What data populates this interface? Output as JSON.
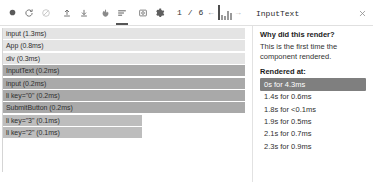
{
  "toolbar": {
    "icons": [
      {
        "name": "record-icon",
        "title": "Start recording"
      },
      {
        "name": "reload-icon",
        "title": "Reload and start profiling"
      },
      {
        "name": "clear-icon",
        "title": "Clear profiling data"
      },
      {
        "name": "upload-icon",
        "title": "Load profile"
      },
      {
        "name": "download-icon",
        "title": "Save profile"
      },
      {
        "name": "flamegraph-icon",
        "title": "Flamegraph chart"
      },
      {
        "name": "ranked-icon",
        "title": "Ranked chart"
      },
      {
        "name": "snapshot-icon",
        "title": "Snapshot"
      },
      {
        "name": "settings-icon",
        "title": "Settings"
      }
    ],
    "page_indicator": "1 / 6",
    "prev_arrow": "←",
    "next_arrow": "→",
    "commit_bars": [
      70,
      22,
      16,
      40,
      30
    ],
    "selected_commit_index": 0,
    "panel_title": "InputText",
    "close_label": "×"
  },
  "flamegraph": {
    "rows": [
      {
        "label": "input (1.3ms)",
        "width_pct": 100,
        "shade": "light"
      },
      {
        "label": "App (0.8ms)",
        "width_pct": 100,
        "shade": "light"
      },
      {
        "label": "div (0.3ms)",
        "width_pct": 100,
        "shade": "light"
      },
      {
        "label": "InputText (0.2ms)",
        "width_pct": 100,
        "shade": "dark"
      },
      {
        "label": "input (0.2ms)",
        "width_pct": 100,
        "shade": "dark"
      },
      {
        "label": "li key=\"0\" (0.2ms)",
        "width_pct": 100,
        "shade": "dark"
      },
      {
        "label": "SubmitButton (0.2ms)",
        "width_pct": 100,
        "shade": "dark"
      },
      {
        "label": "li key=\"3\" (0.1ms)",
        "width_pct": 56,
        "shade": "mid"
      },
      {
        "label": "li key=\"2\" (0.1ms)",
        "width_pct": 56,
        "shade": "mid"
      }
    ]
  },
  "details": {
    "why_heading": "Why did this render?",
    "why_text": "This is the first time the component rendered.",
    "rendered_at_heading": "Rendered at:",
    "timestamps": [
      {
        "label": "0s for 4.3ms",
        "selected": true
      },
      {
        "label": "1.4s for 0.6ms",
        "selected": false
      },
      {
        "label": "1.8s for <0.1ms",
        "selected": false
      },
      {
        "label": "1.9s for 0.5ms",
        "selected": false
      },
      {
        "label": "2.1s for 0.7ms",
        "selected": false
      },
      {
        "label": "2.3s for 0.9ms",
        "selected": false
      }
    ]
  },
  "colors": {
    "row_light": "#e4e4e4",
    "row_dark": "#a9a9a9",
    "row_mid": "#bdbdbd",
    "selected_bg": "#7f7f7f",
    "icon": "#6b6b6b"
  }
}
